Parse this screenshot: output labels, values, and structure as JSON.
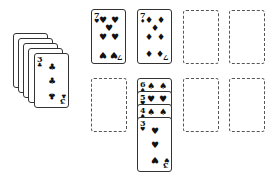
{
  "game": "solitaire",
  "colors": {
    "background": "#ffffff",
    "card_border": "#333333",
    "ink": "#111111",
    "slot_border": "#555555"
  },
  "stock": {
    "back_count": 4,
    "top_card": {
      "rank": "3",
      "suit": "♣",
      "suit_name": "clubs"
    }
  },
  "top_row": [
    {
      "type": "card",
      "rank": "7",
      "suit": "♥",
      "suit_name": "hearts"
    },
    {
      "type": "card",
      "rank": "7",
      "suit": "♦",
      "suit_name": "diamonds"
    },
    {
      "type": "empty-slot"
    },
    {
      "type": "empty-slot"
    }
  ],
  "bottom_row": [
    {
      "type": "empty-slot"
    },
    {
      "type": "cascade",
      "cards": [
        {
          "rank": "6",
          "suit": "♠",
          "suit_name": "spades"
        },
        {
          "rank": "5",
          "suit": "♥",
          "suit_name": "hearts"
        },
        {
          "rank": "4",
          "suit": "♠",
          "suit_name": "spades"
        },
        {
          "rank": "3",
          "suit": "♥",
          "suit_name": "hearts"
        }
      ]
    },
    {
      "type": "empty-slot"
    },
    {
      "type": "empty-slot"
    }
  ]
}
